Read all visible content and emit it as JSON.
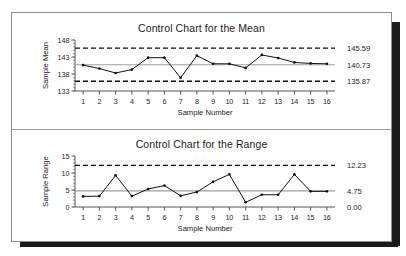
{
  "document": {
    "panels": [
      {
        "id": "mean-chart",
        "title": "Control Chart for the Mean"
      },
      {
        "id": "range-chart",
        "title": "Control Chart for the Range"
      }
    ]
  },
  "chart_data": [
    {
      "type": "line",
      "id": "mean-chart",
      "title": "Control Chart for the Mean",
      "xlabel": "Sample Number",
      "ylabel": "Sample Mean",
      "x": [
        1,
        2,
        3,
        4,
        5,
        6,
        7,
        8,
        9,
        10,
        11,
        12,
        13,
        14,
        15,
        16
      ],
      "categories": [
        "1",
        "2",
        "3",
        "4",
        "5",
        "6",
        "7",
        "8",
        "9",
        "10",
        "11",
        "12",
        "13",
        "14",
        "15",
        "16"
      ],
      "values": [
        140.6,
        139.6,
        138.3,
        139.3,
        142.8,
        142.8,
        136.9,
        143.4,
        141.0,
        141.0,
        139.8,
        143.6,
        142.7,
        141.4,
        141.1,
        141.0
      ],
      "series": [
        {
          "name": "Sample Mean",
          "values": [
            140.6,
            139.6,
            138.3,
            139.3,
            142.8,
            142.8,
            136.9,
            143.4,
            141.0,
            141.0,
            139.8,
            143.6,
            142.7,
            141.4,
            141.1,
            141.0
          ]
        }
      ],
      "ylim": [
        133,
        148
      ],
      "yticks": [
        133,
        138,
        143,
        148
      ],
      "yticklabels": [
        "133",
        "138",
        "143",
        "148"
      ],
      "xlim": [
        0.5,
        16.5
      ],
      "grid": false,
      "legend": "none",
      "control_limits": {
        "ucl": {
          "value": 145.59,
          "label": "145.59",
          "style": "dashed"
        },
        "center": {
          "value": 140.73,
          "label": "140.73",
          "style": "solid"
        },
        "lcl": {
          "value": 135.87,
          "label": "135.87",
          "style": "dashed"
        }
      }
    },
    {
      "type": "line",
      "id": "range-chart",
      "title": "Control Chart for the Range",
      "xlabel": "Sample Number",
      "ylabel": "Sample Range",
      "x": [
        1,
        2,
        3,
        4,
        5,
        6,
        7,
        8,
        9,
        10,
        11,
        12,
        13,
        14,
        15,
        16
      ],
      "categories": [
        "1",
        "2",
        "3",
        "4",
        "5",
        "6",
        "7",
        "8",
        "9",
        "10",
        "11",
        "12",
        "13",
        "14",
        "15",
        "16"
      ],
      "values": [
        3.1,
        3.2,
        9.3,
        3.2,
        5.3,
        6.3,
        3.3,
        4.4,
        7.4,
        9.6,
        1.4,
        3.6,
        3.6,
        9.6,
        4.6,
        4.6
      ],
      "series": [
        {
          "name": "Sample Range",
          "values": [
            3.1,
            3.2,
            9.3,
            3.2,
            5.3,
            6.3,
            3.3,
            4.4,
            7.4,
            9.6,
            1.4,
            3.6,
            3.6,
            9.6,
            4.6,
            4.6
          ]
        }
      ],
      "ylim": [
        0,
        15
      ],
      "yticks": [
        0,
        5,
        10,
        15
      ],
      "yticklabels": [
        "0",
        "5",
        "10",
        "15"
      ],
      "xlim": [
        0.5,
        16.5
      ],
      "grid": false,
      "legend": "none",
      "control_limits": {
        "ucl": {
          "value": 12.23,
          "label": "12.23",
          "style": "dashed"
        },
        "center": {
          "value": 4.75,
          "label": "4.75",
          "style": "solid"
        },
        "lcl": {
          "value": 0.0,
          "label": "0.00",
          "style": "solid"
        }
      }
    }
  ]
}
